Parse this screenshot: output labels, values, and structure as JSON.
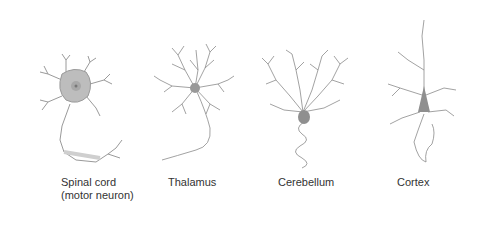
{
  "diagram": {
    "neurons": [
      {
        "id": "spinal-cord",
        "label_lines": [
          "Spinal cord",
          "(motor neuron)"
        ]
      },
      {
        "id": "thalamus",
        "label_lines": [
          "Thalamus"
        ]
      },
      {
        "id": "cerebellum",
        "label_lines": [
          "Cerebellum"
        ]
      },
      {
        "id": "cortex",
        "label_lines": [
          "Cortex"
        ]
      }
    ],
    "colors": {
      "stroke": "#8a8a8a",
      "soma": "#b9b9b9",
      "soma_dark": "#8f8f8f",
      "label": "#333333"
    }
  }
}
